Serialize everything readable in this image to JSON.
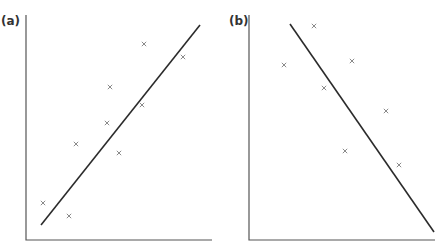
{
  "chart_data": [
    {
      "type": "scatter",
      "panel_label": "(a)",
      "title": "",
      "xlabel": "",
      "ylabel": "",
      "grid": false,
      "legend": null,
      "marker": "x",
      "trend": "positive",
      "points_px": [
        [
          43,
          203
        ],
        [
          69,
          216
        ],
        [
          76,
          144
        ],
        [
          107,
          123
        ],
        [
          110,
          87
        ],
        [
          119,
          153
        ],
        [
          142,
          105
        ],
        [
          144,
          44
        ],
        [
          183,
          57
        ]
      ],
      "fit_line_px": [
        [
          41,
          225
        ],
        [
          200,
          25
        ]
      ],
      "x": [
        0.09,
        0.23,
        0.27,
        0.44,
        0.45,
        0.5,
        0.63,
        0.64,
        0.85
      ],
      "y": [
        0.17,
        0.11,
        0.43,
        0.52,
        0.68,
        0.39,
        0.6,
        0.87,
        0.81
      ]
    },
    {
      "type": "scatter",
      "panel_label": "(b)",
      "title": "",
      "xlabel": "",
      "ylabel": "",
      "grid": false,
      "legend": null,
      "marker": "x",
      "trend": "negative",
      "points_px": [
        [
          314,
          26
        ],
        [
          284,
          65
        ],
        [
          352,
          61
        ],
        [
          324,
          88
        ],
        [
          386,
          111
        ],
        [
          345,
          151
        ],
        [
          399,
          165
        ]
      ],
      "fit_line_px": [
        [
          290,
          24
        ],
        [
          434,
          232
        ]
      ],
      "x": [
        0.35,
        0.19,
        0.56,
        0.41,
        0.74,
        0.52,
        0.81
      ],
      "y": [
        0.95,
        0.78,
        0.8,
        0.68,
        0.57,
        0.39,
        0.33
      ]
    }
  ],
  "panels": {
    "a": {
      "label": "(a)"
    },
    "b": {
      "label": "(b)"
    }
  }
}
